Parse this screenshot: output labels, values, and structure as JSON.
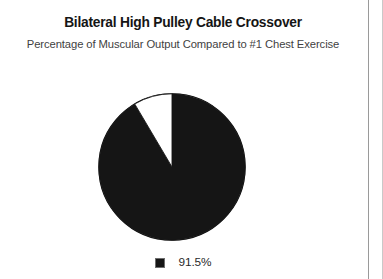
{
  "header": {
    "title": "Bilateral High Pulley Cable Crossover",
    "subtitle": "Percentage of Muscular Output Compared to #1 Chest Exercise"
  },
  "legend": {
    "items": [
      {
        "label": "91.5%",
        "color": "#151515",
        "icon": "square-marker-icon"
      }
    ]
  },
  "colors": {
    "slice_primary": "#151515",
    "slice_remainder": "#ffffff",
    "outline": "#151515",
    "title_text": "#151515",
    "subtitle_text": "#3f3f3f",
    "page_rule": "#9a9a9a"
  },
  "chart_data": {
    "type": "pie",
    "title": "Bilateral High Pulley Cable Crossover",
    "subtitle": "Percentage of Muscular Output Compared to #1 Chest Exercise",
    "labels": [
      "91.5%",
      "8.5%"
    ],
    "values": [
      91.5,
      8.5
    ],
    "value_unit": "percent",
    "colors": [
      "#151515",
      "#ffffff"
    ],
    "start_angle": 90,
    "direction": "counterclockwise",
    "legend": {
      "position": "bottom",
      "entries": [
        "91.5%"
      ]
    },
    "grid": false,
    "xlabel": "",
    "ylabel": ""
  }
}
